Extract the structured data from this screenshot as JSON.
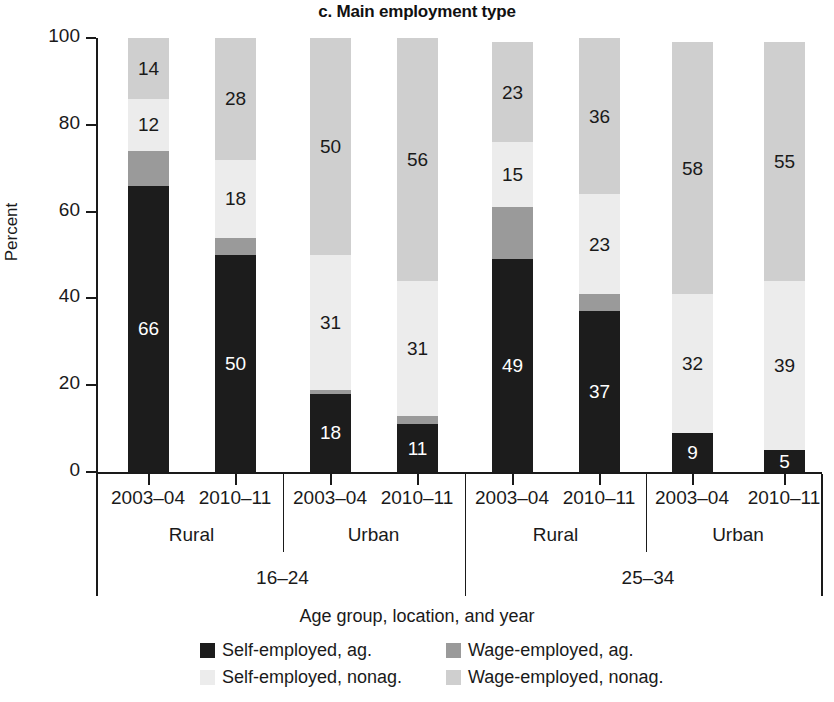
{
  "chart_data": {
    "type": "bar",
    "title": "c. Main employment type",
    "xlabel": "Age group, location, and year",
    "ylabel": "Percent",
    "ylim": [
      0,
      100
    ],
    "yticks": [
      0,
      20,
      40,
      60,
      80,
      100
    ],
    "grid": false,
    "stacked": true,
    "legend_position": "bottom",
    "categories": [
      "16-24 / Rural / 2003-04",
      "16-24 / Rural / 2010-11",
      "16-24 / Urban / 2003-04",
      "16-24 / Urban / 2010-11",
      "25-34 / Rural / 2003-04",
      "25-34 / Rural / 2010-11",
      "25-34 / Urban / 2003-04",
      "25-34 / Urban / 2010-11"
    ],
    "series": [
      {
        "name": "Self-employed, ag.",
        "color": "#1c1c1c",
        "values": [
          66,
          50,
          18,
          11,
          49,
          37,
          9,
          5
        ],
        "labels": [
          "66",
          "50",
          "18",
          "11",
          "49",
          "37",
          "9",
          "5"
        ]
      },
      {
        "name": "Wage-employed, ag.",
        "color": "#9a9a9a",
        "values": [
          8,
          4,
          1,
          2,
          12,
          4,
          0,
          0
        ],
        "labels": [
          "",
          "",
          "",
          "",
          "",
          "",
          "",
          ""
        ]
      },
      {
        "name": "Self-employed, nonag.",
        "color": "#ececec",
        "values": [
          12,
          18,
          31,
          31,
          15,
          23,
          32,
          39
        ],
        "labels": [
          "12",
          "18",
          "31",
          "31",
          "15",
          "23",
          "32",
          "39"
        ]
      },
      {
        "name": "Wage-employed, nonag.",
        "color": "#cfcfcf",
        "values": [
          14,
          28,
          50,
          56,
          23,
          36,
          58,
          55
        ],
        "labels": [
          "14",
          "28",
          "50",
          "56",
          "23",
          "36",
          "58",
          "55"
        ]
      }
    ]
  },
  "axis": {
    "y_title": "Percent",
    "y_tick_labels": [
      "100",
      "80",
      "60",
      "40",
      "20",
      "0"
    ],
    "x_title": "Age group, location, and year",
    "years": [
      "2003–04",
      "2010–11",
      "2003–04",
      "2010–11",
      "2003–04",
      "2010–11",
      "2003–04",
      "2010–11"
    ],
    "locations": [
      "Rural",
      "Urban",
      "Rural",
      "Urban"
    ],
    "age_groups": [
      "16–24",
      "25–34"
    ]
  },
  "legend": {
    "items": [
      {
        "label": "Self-employed, ag.",
        "color": "#1c1c1c"
      },
      {
        "label": "Wage-employed, ag.",
        "color": "#9a9a9a"
      },
      {
        "label": "Self-employed, nonag.",
        "color": "#ececec"
      },
      {
        "label": "Wage-employed, nonag.",
        "color": "#cfcfcf"
      }
    ]
  }
}
